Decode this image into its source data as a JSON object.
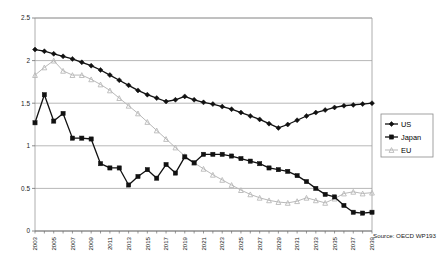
{
  "chart_data": {
    "type": "line",
    "title": "",
    "subtitle": "",
    "xlabel": "",
    "ylabel": "",
    "ylim": [
      0,
      2.5
    ],
    "ytick_labels": [
      "0",
      "0.5",
      "1",
      "1.5",
      "2",
      "2.5"
    ],
    "ytick_values": [
      0,
      0.5,
      1,
      1.5,
      2,
      2.5
    ],
    "grid": true,
    "grid_axis": "y",
    "legend_position": "right",
    "x": [
      2003,
      2004,
      2005,
      2006,
      2007,
      2008,
      2009,
      2010,
      2011,
      2012,
      2013,
      2014,
      2015,
      2016,
      2017,
      2018,
      2019,
      2020,
      2021,
      2022,
      2023,
      2024,
      2025,
      2026,
      2027,
      2028,
      2029,
      2030,
      2031,
      2032,
      2033,
      2034,
      2035,
      2036,
      2037,
      2038,
      2039
    ],
    "xtick_labels": [
      "2003",
      "2005",
      "2007",
      "2009",
      "2011",
      "2013",
      "2015",
      "2017",
      "2019",
      "2021",
      "2023",
      "2025",
      "2027",
      "2029",
      "2031",
      "2033",
      "2035",
      "2037",
      "2039"
    ],
    "xtick_values": [
      2003,
      2005,
      2007,
      2009,
      2011,
      2013,
      2015,
      2017,
      2019,
      2021,
      2023,
      2025,
      2027,
      2029,
      2031,
      2033,
      2035,
      2037,
      2039
    ],
    "series": [
      {
        "name": "US",
        "marker": "diamond",
        "color": "#111111",
        "values": [
          2.13,
          2.11,
          2.08,
          2.05,
          2.02,
          1.98,
          1.94,
          1.89,
          1.83,
          1.77,
          1.71,
          1.65,
          1.6,
          1.56,
          1.52,
          1.54,
          1.58,
          1.54,
          1.51,
          1.49,
          1.46,
          1.43,
          1.39,
          1.35,
          1.31,
          1.26,
          1.21,
          1.25,
          1.3,
          1.35,
          1.39,
          1.42,
          1.45,
          1.47,
          1.48,
          1.49,
          1.5
        ]
      },
      {
        "name": "Japan",
        "marker": "square",
        "color": "#111111",
        "values": [
          1.27,
          1.6,
          1.29,
          1.38,
          1.09,
          1.09,
          1.08,
          0.79,
          0.74,
          0.74,
          0.54,
          0.64,
          0.72,
          0.62,
          0.78,
          0.68,
          0.87,
          0.8,
          0.9,
          0.9,
          0.9,
          0.88,
          0.85,
          0.82,
          0.79,
          0.74,
          0.72,
          0.7,
          0.65,
          0.58,
          0.5,
          0.43,
          0.4,
          0.3,
          0.22,
          0.21,
          0.22
        ]
      },
      {
        "name": "EU",
        "marker": "triangle",
        "color": "#b9b9b9",
        "values": [
          1.83,
          1.92,
          2.0,
          1.88,
          1.83,
          1.83,
          1.78,
          1.72,
          1.65,
          1.56,
          1.47,
          1.38,
          1.28,
          1.18,
          1.08,
          0.98,
          0.88,
          0.8,
          0.73,
          0.66,
          0.6,
          0.54,
          0.48,
          0.43,
          0.39,
          0.36,
          0.34,
          0.33,
          0.35,
          0.39,
          0.36,
          0.33,
          0.38,
          0.44,
          0.46,
          0.44,
          0.45
        ]
      }
    ],
    "annotations": [
      {
        "name": "source-note",
        "text": "Source: OECD WP193"
      }
    ]
  },
  "legend": {
    "entries": [
      {
        "label": "US"
      },
      {
        "label": "Japan"
      },
      {
        "label": "EU"
      }
    ]
  },
  "source": {
    "text": "Source: OECD WP193"
  },
  "colors": {
    "us": "#111111",
    "japan": "#111111",
    "eu": "#b9b9b9",
    "grid": "#9a9a9a",
    "axis": "#6e6e6e",
    "background": "#ffffff"
  }
}
